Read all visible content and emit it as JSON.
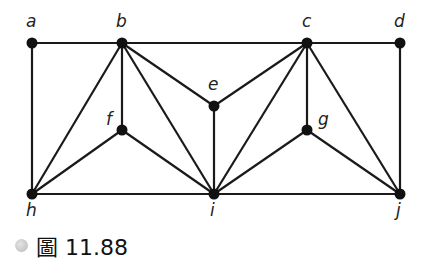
{
  "figure": {
    "caption_prefix": "圖",
    "caption_number": "11.88",
    "caption": "圖 11.88"
  },
  "graph": {
    "nodes": [
      {
        "id": "a",
        "label": "a",
        "x": 32,
        "y": 43,
        "lx": 26,
        "ly": 27
      },
      {
        "id": "b",
        "label": "b",
        "x": 122,
        "y": 43,
        "lx": 116,
        "ly": 27
      },
      {
        "id": "c",
        "label": "c",
        "x": 307,
        "y": 43,
        "lx": 302,
        "ly": 27
      },
      {
        "id": "d",
        "label": "d",
        "x": 400,
        "y": 43,
        "lx": 394,
        "ly": 27
      },
      {
        "id": "e",
        "label": "e",
        "x": 214,
        "y": 106,
        "lx": 208,
        "ly": 90
      },
      {
        "id": "f",
        "label": "f",
        "x": 122,
        "y": 130,
        "lx": 106,
        "ly": 125
      },
      {
        "id": "g",
        "label": "g",
        "x": 307,
        "y": 130,
        "lx": 318,
        "ly": 125
      },
      {
        "id": "h",
        "label": "h",
        "x": 32,
        "y": 194,
        "lx": 26,
        "ly": 216
      },
      {
        "id": "i",
        "label": "i",
        "x": 214,
        "y": 194,
        "lx": 210,
        "ly": 216
      },
      {
        "id": "j",
        "label": "j",
        "x": 400,
        "y": 194,
        "lx": 396,
        "ly": 216
      }
    ],
    "edges": [
      [
        "a",
        "b"
      ],
      [
        "b",
        "c"
      ],
      [
        "c",
        "d"
      ],
      [
        "a",
        "h"
      ],
      [
        "d",
        "j"
      ],
      [
        "h",
        "i"
      ],
      [
        "i",
        "j"
      ],
      [
        "b",
        "f"
      ],
      [
        "b",
        "h"
      ],
      [
        "b",
        "i"
      ],
      [
        "b",
        "e"
      ],
      [
        "f",
        "h"
      ],
      [
        "f",
        "i"
      ],
      [
        "e",
        "i"
      ],
      [
        "c",
        "e"
      ],
      [
        "c",
        "i"
      ],
      [
        "c",
        "g"
      ],
      [
        "c",
        "j"
      ],
      [
        "g",
        "i"
      ],
      [
        "g",
        "j"
      ]
    ]
  }
}
